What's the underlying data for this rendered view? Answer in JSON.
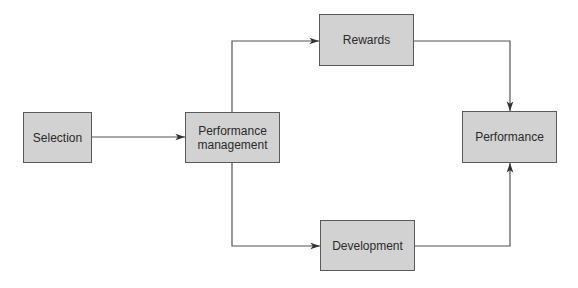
{
  "diagram": {
    "type": "flowchart",
    "colors": {
      "node_fill": "#d2d2d2",
      "node_border": "#5a5a5a",
      "line": "#555555",
      "text": "#2a2a2a"
    },
    "nodes": [
      {
        "id": "selection",
        "label": "Selection"
      },
      {
        "id": "performance_management",
        "label": "Performance\nmanagement"
      },
      {
        "id": "rewards",
        "label": "Rewards"
      },
      {
        "id": "development",
        "label": "Development"
      },
      {
        "id": "performance",
        "label": "Performance"
      }
    ],
    "edges": [
      {
        "from": "selection",
        "to": "performance_management"
      },
      {
        "from": "performance_management",
        "to": "rewards"
      },
      {
        "from": "performance_management",
        "to": "development"
      },
      {
        "from": "rewards",
        "to": "performance"
      },
      {
        "from": "development",
        "to": "performance"
      }
    ]
  }
}
